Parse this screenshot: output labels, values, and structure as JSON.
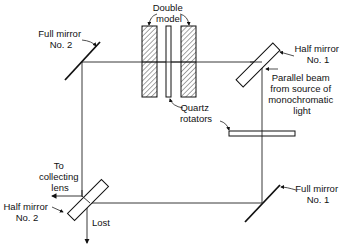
{
  "diagram": {
    "type": "optical interferometer schematic",
    "labels": {
      "double_model": [
        "Double",
        "model"
      ],
      "full_mirror_2": [
        "Full mirror",
        "No. 2"
      ],
      "half_mirror_1": [
        "Half mirror",
        "No. 1"
      ],
      "parallel_beam": [
        "Parallel beam",
        "from source of",
        "monochromatic",
        "light"
      ],
      "quartz_rotators": [
        "Quartz",
        "rotators"
      ],
      "to_collecting_lens": [
        "To",
        "collecting",
        "lens"
      ],
      "half_mirror_2": [
        "Half mirror",
        "No. 2"
      ],
      "lost": "Lost",
      "full_mirror_1": [
        "Full mirror",
        "No. 1"
      ]
    },
    "components": [
      {
        "id": "full-mirror-2",
        "kind": "full mirror",
        "position": "top-left"
      },
      {
        "id": "double-model-left",
        "kind": "model block (hatched)",
        "position": "top-center"
      },
      {
        "id": "quartz-rotator-upper",
        "kind": "quartz plate",
        "position": "top-center"
      },
      {
        "id": "double-model-right",
        "kind": "model block (hatched)",
        "position": "top-center"
      },
      {
        "id": "half-mirror-1",
        "kind": "half mirror",
        "position": "top-right"
      },
      {
        "id": "quartz-rotator-lower",
        "kind": "quartz plate",
        "position": "right-middle"
      },
      {
        "id": "full-mirror-1",
        "kind": "full mirror",
        "position": "bottom-right"
      },
      {
        "id": "half-mirror-2",
        "kind": "half mirror",
        "position": "bottom-left"
      }
    ],
    "colors": {
      "ink": "#111111",
      "background": "#ffffff"
    }
  }
}
